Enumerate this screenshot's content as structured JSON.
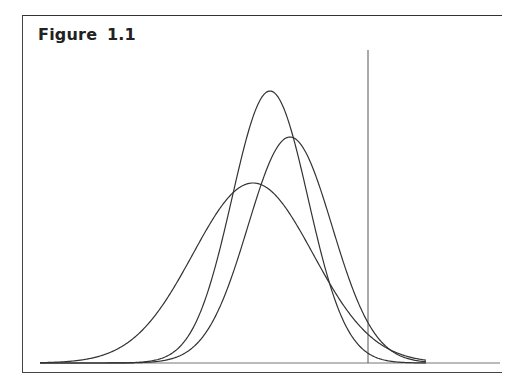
{
  "figure": {
    "title": "Figure 1.1"
  },
  "chart_data": {
    "type": "line",
    "title": "Figure 1.1",
    "xlabel": "",
    "ylabel": "",
    "grid": false,
    "legend": null,
    "baseline_y_px": 363,
    "baseline_x_range_px": [
      40,
      500
    ],
    "reference_line": {
      "x_px": 368,
      "y_top_px": 50,
      "y_bottom_px": 363
    },
    "series": [
      {
        "name": "curve-tall-narrow",
        "mean_px": 270,
        "sigma_px": 38,
        "peak_y_px": 91,
        "x_range_px": [
          40,
          426
        ]
      },
      {
        "name": "curve-medium",
        "mean_px": 290,
        "sigma_px": 42,
        "peak_y_px": 137,
        "x_range_px": [
          40,
          426
        ]
      },
      {
        "name": "curve-wide-short",
        "mean_px": 253,
        "sigma_px": 60,
        "peak_y_px": 183,
        "x_range_px": [
          40,
          426
        ]
      }
    ],
    "colors": {
      "line": "#333333",
      "reference": "#555555",
      "baseline": "#777777"
    }
  }
}
